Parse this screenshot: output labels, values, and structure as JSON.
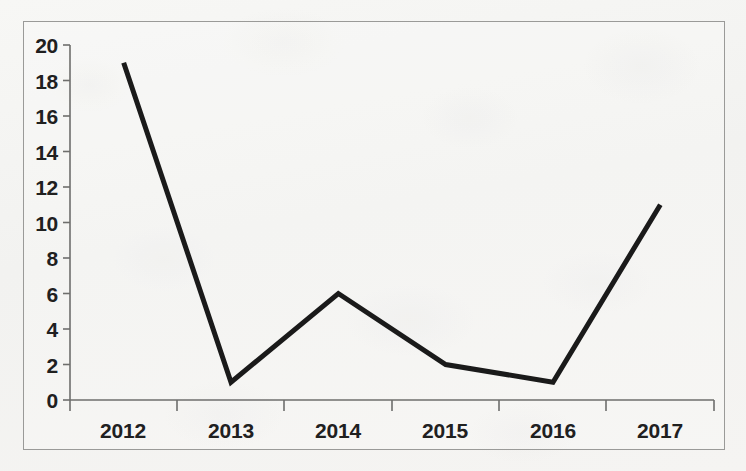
{
  "chart_data": {
    "type": "line",
    "title": "",
    "subtitle": "",
    "xlabel": "",
    "ylabel": "",
    "categories": [
      "2012",
      "2013",
      "2014",
      "2015",
      "2016",
      "2017"
    ],
    "values": [
      19,
      1,
      6,
      2,
      1,
      11
    ],
    "series": [
      {
        "name": "",
        "values": [
          19,
          1,
          6,
          2,
          1,
          11
        ]
      }
    ],
    "ylim": [
      0,
      20
    ],
    "ytick_step": 2,
    "ytick_labels": [
      "20",
      "18",
      "16",
      "14",
      "12",
      "10",
      "8",
      "6",
      "4",
      "2",
      "0"
    ],
    "ytick_values": [
      20,
      18,
      16,
      14,
      12,
      10,
      8,
      6,
      4,
      2,
      0
    ],
    "xtick_labels": [
      "2012",
      "2013",
      "2014",
      "2015",
      "2016",
      "2017"
    ],
    "grid": false,
    "legend": null,
    "legend_position": "none",
    "markers": false,
    "annotations": [],
    "line_color": "#1a1a1a",
    "line_width": 5,
    "axis_color": "#6e6e6c",
    "frame_color": "#9a9a98",
    "background_color": "#f2f2f0",
    "text_color": "#20201f"
  }
}
